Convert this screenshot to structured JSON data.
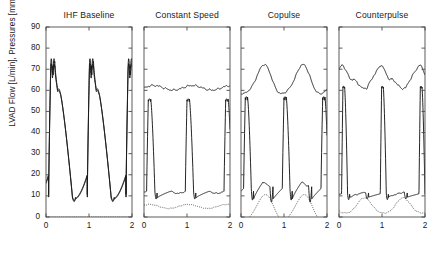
{
  "figure": {
    "ylabel": "LVAD Flow [L/min], Pressures [mmHg]",
    "ytick_labels": [
      "0",
      "10",
      "20",
      "30",
      "40",
      "50",
      "60",
      "70",
      "80",
      "90"
    ],
    "xtick_labels": [
      "0",
      "1",
      "2"
    ]
  },
  "chart_data": {
    "type": "line",
    "title": "",
    "xlabel": "",
    "ylabel": "LVAD Flow [L/min], Pressures [mmHg]",
    "xlim": [
      0,
      2
    ],
    "ylim": [
      0,
      90
    ],
    "xticks": [
      0,
      1,
      2
    ],
    "yticks": [
      0,
      10,
      20,
      30,
      40,
      50,
      60,
      70,
      80,
      90
    ],
    "grid": false,
    "legend": "none",
    "panel_layout": "1x4",
    "cycle_period_s": 0.9,
    "panels": [
      {
        "title": "IHF Baseline",
        "series": [
          {
            "name": "aortic-pressure",
            "style": "solid",
            "description": "Double-peaked systolic pressure waveform, peaks near 73-75 mmHg with notched top, decaying to about 8-10 mmHg in diastole",
            "peak": 75,
            "secondary_peak": 73,
            "shoulder": 60,
            "trough": 8,
            "start_value": 20
          },
          {
            "name": "ventricular-pressure",
            "style": "solid",
            "description": "Overlaps the aortic trace rising from diastolic minimum through systolic peak and decaying along a slow diastolic limb",
            "peak": 74,
            "trough": 9
          },
          {
            "name": "lvad-flow",
            "style": "dotted",
            "description": "Flat at zero, no pump support in baseline ischemic heart failure",
            "constant_value": 0
          }
        ]
      },
      {
        "title": "Constant Speed",
        "series": [
          {
            "name": "aortic-pressure",
            "style": "solid",
            "description": "Nearly flat, mildly undulating trace around 60-63 mmHg",
            "mean": 61,
            "max": 63,
            "min": 59.5
          },
          {
            "name": "ventricular-pressure",
            "style": "solid",
            "description": "Narrow tall systolic spikes rising from about 9 mmHg to 56 mmHg each cycle",
            "peak": 56,
            "trough": 8.5,
            "baseline": 11
          },
          {
            "name": "lvad-flow",
            "style": "dotted",
            "description": "Low-amplitude pump flow oscillating gently between about 4 and 6 L/min",
            "mean": 5,
            "max": 6,
            "min": 4
          }
        ]
      },
      {
        "title": "Copulse",
        "series": [
          {
            "name": "aortic-pressure",
            "style": "solid",
            "description": "Large smooth sinusoidal oscillation between about 58 and 71 mmHg synchronized with the cardiac cycle",
            "max": 71,
            "min": 57.5,
            "mean": 64
          },
          {
            "name": "ventricular-pressure",
            "style": "solid",
            "description": "Tall narrow systolic spikes reaching about 57 mmHg, falling back to roughly 9 mmHg",
            "peak": 57,
            "trough": 7.5,
            "baseline": 13
          },
          {
            "name": "lvad-flow",
            "style": "dotted",
            "description": "Strongly pulsatile pump flow swinging from about -2 to 10 L/min, dipping below zero each cycle",
            "max": 10,
            "min": -2,
            "mean": 4.5
          }
        ]
      },
      {
        "title": "Counterpulse",
        "series": [
          {
            "name": "aortic-pressure",
            "style": "solid",
            "description": "Rounded oscillation between about 61 and 72 mmHg with a flattened diastolic plateau",
            "max": 72,
            "min": 61,
            "mean": 66
          },
          {
            "name": "ventricular-pressure",
            "style": "solid",
            "description": "Very narrow tall systolic spikes reaching about 62 mmHg from a baseline near 10 mmHg",
            "peak": 62,
            "trough": 8,
            "baseline": 11
          },
          {
            "name": "lvad-flow",
            "style": "dotted",
            "description": "Pump flow oscillating between about 1 and 9 L/min, out of phase with the cardiac cycle",
            "max": 9,
            "min": 1,
            "mean": 5
          }
        ]
      }
    ]
  }
}
